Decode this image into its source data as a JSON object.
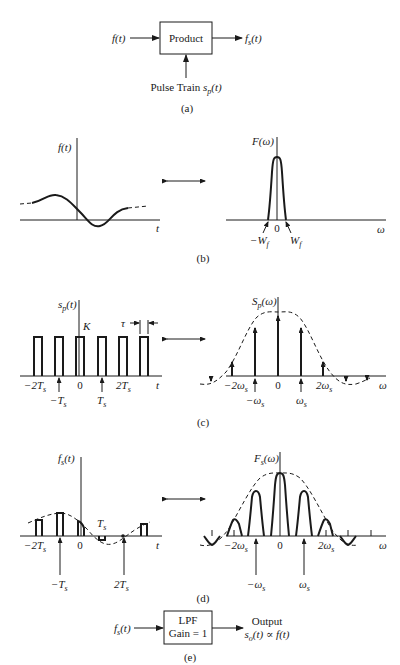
{
  "panel_a": {
    "input": "f(t)",
    "block": "Product",
    "output": "f_s(t)",
    "output_display": "f",
    "output_sub": "s",
    "output_tail": "(t)",
    "bottom_input_pre": "Pulse Train ",
    "bottom_input_var": "s",
    "bottom_input_sub": "p",
    "bottom_input_tail": "(t)",
    "caption": "(a)"
  },
  "panel_b": {
    "left_ylabel": "f(t)",
    "left_xlabel": "t",
    "right_ylabel": "F(ω)",
    "right_xlabel": "ω",
    "zero": "0",
    "neg_w": "−W",
    "pos_w": "W",
    "w_sub": "f",
    "caption": "(b)"
  },
  "panel_c": {
    "left_ylabel_var": "s",
    "left_ylabel_sub": "p",
    "left_ylabel_tail": "(t)",
    "height_label": "K",
    "width_label": "τ",
    "ticks": {
      "m2": "−2T",
      "zero": "0",
      "p2": "2T",
      "m1": "−T",
      "p1": "T",
      "sub": "s"
    },
    "left_xlabel": "t",
    "right_ylabel_var": "S",
    "right_ylabel_sub": "p",
    "right_ylabel_tail": "(ω)",
    "right_ticks": {
      "m2": "−2ω",
      "zero": "0",
      "p2": "2ω",
      "m1": "−ω",
      "p1": "ω",
      "sub": "s"
    },
    "right_xlabel": "ω",
    "caption": "(c)"
  },
  "panel_d": {
    "left_ylabel_var": "f",
    "left_ylabel_sub": "s",
    "left_ylabel_tail": "(t)",
    "ticks": {
      "m2": "−2T",
      "zero": "0",
      "ts": "T",
      "m1": "−T",
      "p2": "2T",
      "sub": "s"
    },
    "left_xlabel": "t",
    "right_ylabel_var": "F",
    "right_ylabel_sub": "s",
    "right_ylabel_tail": "(ω)",
    "right_ticks": {
      "m2": "−2ω",
      "zero": "0",
      "p2": "2ω",
      "m1": "−ω",
      "p1": "ω",
      "sub": "s"
    },
    "right_xlabel": "ω",
    "caption": "(d)"
  },
  "panel_e": {
    "input_var": "f",
    "input_sub": "s",
    "input_tail": "(t)",
    "block_line1": "LPF",
    "block_line2": "Gain = 1",
    "output_line1": "Output",
    "output_line2_var": "s",
    "output_line2_sub": "o",
    "output_line2_tail": "(t) ∝ f(t)",
    "caption": "(e)"
  },
  "colors": {
    "ink": "#1a1a1a",
    "background": "#ffffff"
  }
}
